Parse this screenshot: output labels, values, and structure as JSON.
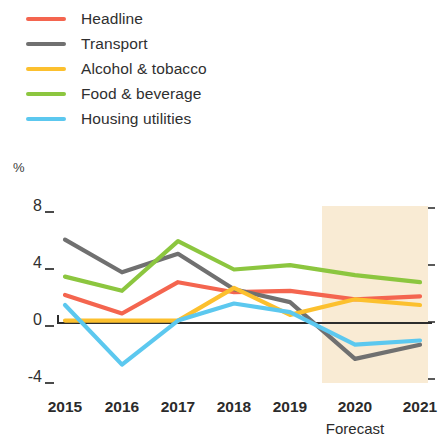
{
  "legend": {
    "position": "top-left",
    "items": [
      {
        "label": "Headline",
        "color": "#f4654f",
        "key": "headline"
      },
      {
        "label": "Transport",
        "color": "#707070",
        "key": "transport"
      },
      {
        "label": "Alcohol & tobacco",
        "color": "#fcc02e",
        "key": "alcohol_tobacco"
      },
      {
        "label": "Food & beverage",
        "color": "#8cc63f",
        "key": "food_beverage"
      },
      {
        "label": "Housing utilities",
        "color": "#5cc8ef",
        "key": "housing_utilities"
      }
    ]
  },
  "axes": {
    "y_unit_label": "%",
    "y_ticks": [
      "8",
      "4",
      "0",
      "-4"
    ],
    "x_ticks": [
      "2015",
      "2016",
      "2017",
      "2018",
      "2019",
      "2020",
      "2021"
    ]
  },
  "annotations": {
    "forecast_caption": "Forecast",
    "forecast_band_color": "#f8e7cd",
    "forecast_start_year": "2020"
  },
  "chart_data": {
    "type": "line",
    "title": "",
    "subtitle": "",
    "xlabel": "",
    "ylabel": "%",
    "categories": [
      "2015",
      "2016",
      "2017",
      "2018",
      "2019",
      "2020",
      "2021"
    ],
    "ylim": [
      -4,
      8
    ],
    "y_ticks": [
      8,
      4,
      0,
      -4
    ],
    "grid": false,
    "legend_position": "top-left",
    "zero_line": true,
    "forecast_region": {
      "from": "2019.6",
      "to": "2021",
      "label": "Forecast"
    },
    "series": [
      {
        "name": "Headline",
        "color": "#f4654f",
        "values": [
          1.9,
          0.6,
          2.8,
          2.1,
          2.2,
          1.6,
          1.8
        ]
      },
      {
        "name": "Transport",
        "color": "#707070",
        "values": [
          5.8,
          3.5,
          4.8,
          2.3,
          1.4,
          -2.6,
          -1.6
        ]
      },
      {
        "name": "Alcohol & tobacco",
        "color": "#fcc02e",
        "values": [
          0.1,
          0.1,
          0.1,
          2.4,
          0.5,
          1.6,
          1.2
        ]
      },
      {
        "name": "Food & beverage",
        "color": "#8cc63f",
        "values": [
          3.2,
          2.2,
          5.7,
          3.7,
          4.0,
          3.3,
          2.8
        ]
      },
      {
        "name": "Housing utilities",
        "color": "#5cc8ef",
        "values": [
          1.2,
          -3.0,
          0.1,
          1.3,
          0.7,
          -1.6,
          -1.3
        ]
      }
    ]
  },
  "geometry": {
    "x_positions": [
      65,
      122,
      178,
      234,
      290,
      355,
      420
    ],
    "y_zero_px": 322,
    "px_per_unit": 14.2,
    "plot_top_offset": 150,
    "band_x0": 322,
    "band_x1": 428,
    "band_y0": 206,
    "band_y1": 383
  }
}
